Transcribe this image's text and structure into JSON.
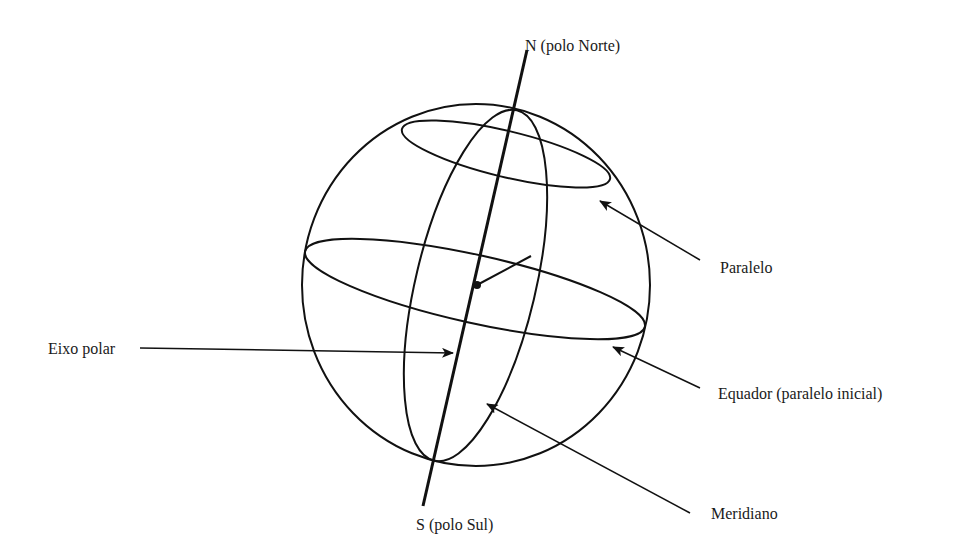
{
  "diagram": {
    "labels": {
      "north": "N (polo Norte)",
      "south": "S (polo Sul)",
      "parallel": "Paralelo",
      "equator": "Equador (paralelo inicial)",
      "meridian": "Meridiano",
      "axis": "Eixo polar"
    },
    "colors": {
      "line": "#111111",
      "text": "#1a1a1a",
      "background": "#ffffff"
    }
  }
}
